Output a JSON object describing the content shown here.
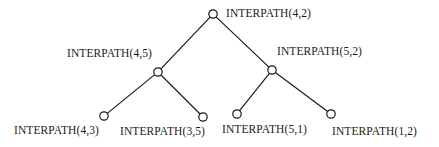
{
  "figure": {
    "type": "binary-tree-diagram",
    "background_color": "#ffffff",
    "stroke_color": "#1a1a1a",
    "node_fill_color": "#ffffff",
    "node_radius": 4.2,
    "edge_width": 1.2
  },
  "nodes": [
    {
      "id": "root",
      "label": "INTERPATH(4,2)",
      "level": 0,
      "cx": 213,
      "cy": 14,
      "label_x": 226,
      "label_y": 7,
      "label_align": "left"
    },
    {
      "id": "left",
      "label": "INTERPATH(4,5)",
      "level": 1,
      "cx": 158,
      "cy": 72,
      "label_x": 67,
      "label_y": 47,
      "label_align": "left"
    },
    {
      "id": "right",
      "label": "INTERPATH(5,2)",
      "level": 1,
      "cx": 272,
      "cy": 70,
      "label_x": 277,
      "label_y": 45,
      "label_align": "left"
    },
    {
      "id": "leaf1",
      "label": "INTERPATH(4,3)",
      "level": 2,
      "cx": 104,
      "cy": 116,
      "label_x": 14,
      "label_y": 124,
      "label_align": "left"
    },
    {
      "id": "leaf2",
      "label": "INTERPATH(3,5)",
      "level": 2,
      "cx": 203,
      "cy": 117,
      "label_x": 120,
      "label_y": 125,
      "label_align": "left"
    },
    {
      "id": "leaf3",
      "label": "INTERPATH(5,1)",
      "level": 2,
      "cx": 237,
      "cy": 114,
      "label_x": 222,
      "label_y": 123,
      "label_align": "left"
    },
    {
      "id": "leaf4",
      "label": "INTERPATH(1,2)",
      "level": 2,
      "cx": 331,
      "cy": 114,
      "label_x": 332,
      "label_y": 125,
      "label_align": "left"
    }
  ],
  "edges": [
    {
      "from": "root",
      "to": "left",
      "x1": 213,
      "y1": 14,
      "x2": 158,
      "y2": 72
    },
    {
      "from": "root",
      "to": "right",
      "x1": 213,
      "y1": 14,
      "x2": 272,
      "y2": 70
    },
    {
      "from": "left",
      "to": "leaf1",
      "x1": 158,
      "y1": 72,
      "x2": 104,
      "y2": 116
    },
    {
      "from": "left",
      "to": "leaf2",
      "x1": 158,
      "y1": 72,
      "x2": 203,
      "y2": 117
    },
    {
      "from": "right",
      "to": "leaf3",
      "x1": 272,
      "y1": 70,
      "x2": 237,
      "y2": 114
    },
    {
      "from": "right",
      "to": "leaf4",
      "x1": 272,
      "y1": 70,
      "x2": 331,
      "y2": 114
    }
  ]
}
